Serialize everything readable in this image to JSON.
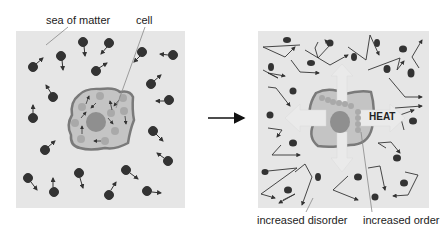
{
  "labels": {
    "sea_of_matter": "sea of matter",
    "cell": "cell",
    "heat": "HEAT",
    "increased_disorder": "increased disorder",
    "increased_order": "increased order"
  },
  "colors": {
    "panel_bg": "#e6e6e6",
    "particle": "#333333",
    "cell_membrane": "#7a7a7a",
    "cytoplasm": "#c4c4c4",
    "organelle": "#a9a9a9",
    "nucleus": "#8f8f8f",
    "heat_arrow": "#eaeaea"
  }
}
